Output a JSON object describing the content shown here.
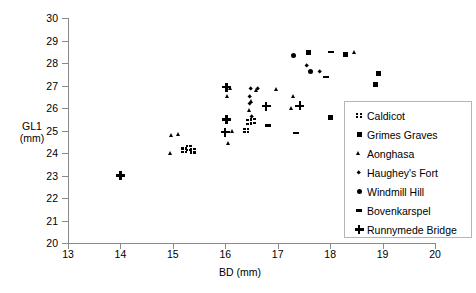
{
  "chart_data": {
    "type": "scatter",
    "title": "",
    "xlabel": "BD (mm)",
    "ylabel": "GL1 (mm)",
    "ylabel_lines": [
      "GL1",
      "(mm)"
    ],
    "xlim": [
      13,
      20
    ],
    "ylim": [
      20,
      30
    ],
    "xticks": [
      13,
      14,
      15,
      16,
      17,
      18,
      19,
      20
    ],
    "yticks": [
      20,
      21,
      22,
      23,
      24,
      25,
      26,
      27,
      28,
      29,
      30
    ],
    "grid": false,
    "legend_position": "right-inside",
    "series": [
      {
        "name": "Caldicot",
        "marker": "checker-square",
        "points": [
          {
            "x": 15.22,
            "y": 24.12
          },
          {
            "x": 15.3,
            "y": 24.22
          },
          {
            "x": 15.38,
            "y": 24.1
          },
          {
            "x": 16.46,
            "y": 25.38
          },
          {
            "x": 16.4,
            "y": 25.0
          },
          {
            "x": 16.52,
            "y": 25.42
          }
        ]
      },
      {
        "name": "Grimes Graves",
        "marker": "square",
        "points": [
          {
            "x": 17.58,
            "y": 28.48
          },
          {
            "x": 18.3,
            "y": 28.36
          },
          {
            "x": 18.92,
            "y": 27.52
          },
          {
            "x": 18.86,
            "y": 27.06
          },
          {
            "x": 18.0,
            "y": 25.6
          }
        ]
      },
      {
        "name": "Aonghasa",
        "marker": "triangle",
        "points": [
          {
            "x": 14.98,
            "y": 24.76
          },
          {
            "x": 15.1,
            "y": 24.82
          },
          {
            "x": 14.96,
            "y": 23.96
          },
          {
            "x": 16.1,
            "y": 26.88
          },
          {
            "x": 16.04,
            "y": 26.52
          },
          {
            "x": 16.14,
            "y": 24.96
          },
          {
            "x": 16.06,
            "y": 24.42
          },
          {
            "x": 16.6,
            "y": 26.78
          },
          {
            "x": 16.98,
            "y": 26.82
          },
          {
            "x": 17.3,
            "y": 26.5
          },
          {
            "x": 17.26,
            "y": 25.98
          },
          {
            "x": 18.46,
            "y": 28.46
          },
          {
            "x": 16.5,
            "y": 26.3
          },
          {
            "x": 16.46,
            "y": 25.88
          }
        ]
      },
      {
        "name": "Haughey's Fort",
        "marker": "diamond",
        "points": [
          {
            "x": 16.48,
            "y": 26.84
          },
          {
            "x": 16.62,
            "y": 26.86
          },
          {
            "x": 16.46,
            "y": 26.52
          },
          {
            "x": 16.46,
            "y": 26.18
          },
          {
            "x": 16.5,
            "y": 25.62
          },
          {
            "x": 17.8,
            "y": 27.62
          },
          {
            "x": 17.56,
            "y": 27.9
          }
        ]
      },
      {
        "name": "Windmill Hill",
        "marker": "circle",
        "points": [
          {
            "x": 17.3,
            "y": 28.34
          },
          {
            "x": 17.62,
            "y": 27.62
          }
        ]
      },
      {
        "name": "Bovenkarspel",
        "marker": "dash",
        "points": [
          {
            "x": 18.02,
            "y": 28.48
          },
          {
            "x": 17.92,
            "y": 27.38
          },
          {
            "x": 17.34,
            "y": 24.9
          },
          {
            "x": 16.82,
            "y": 25.22
          }
        ]
      },
      {
        "name": "Runnymede Bridge",
        "marker": "plus",
        "points": [
          {
            "x": 14.0,
            "y": 23.0
          },
          {
            "x": 16.02,
            "y": 26.92
          },
          {
            "x": 16.02,
            "y": 25.48
          },
          {
            "x": 16.0,
            "y": 24.92
          },
          {
            "x": 16.78,
            "y": 26.08
          },
          {
            "x": 17.42,
            "y": 26.1
          }
        ]
      }
    ]
  },
  "axes": {
    "y_title_line1": "GL1",
    "y_title_line2": "(mm)",
    "x_title": "BD (mm)",
    "y_tick_labels": [
      "30",
      "29",
      "28",
      "27",
      "26",
      "25",
      "24",
      "23",
      "22",
      "21",
      "20"
    ],
    "x_tick_labels": [
      "13",
      "14",
      "15",
      "16",
      "17",
      "18",
      "19",
      "20"
    ]
  },
  "legend": {
    "items": [
      {
        "label": "Caldicot",
        "marker": "checker-square"
      },
      {
        "label": "Grimes Graves",
        "marker": "square"
      },
      {
        "label": "Aonghasa",
        "marker": "triangle"
      },
      {
        "label": "Haughey's Fort",
        "marker": "diamond"
      },
      {
        "label": "Windmill Hill",
        "marker": "circle"
      },
      {
        "label": "Bovenkarspel",
        "marker": "dash"
      },
      {
        "label": "Runnymede Bridge",
        "marker": "plus"
      }
    ]
  },
  "colors": {
    "marker": "#000000",
    "axis": "#8a8a8a",
    "legend_border": "#b5b5b5",
    "background": "#ffffff"
  }
}
